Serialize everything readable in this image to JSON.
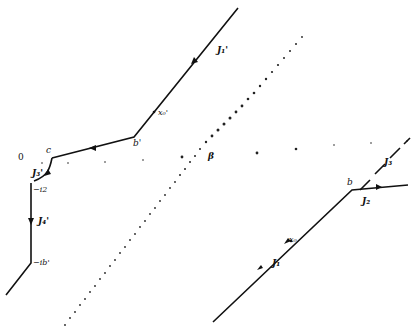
{
  "diagram": {
    "type": "complex-plane contour diagram",
    "colors": {
      "line": "#111111",
      "background": "#ffffff",
      "dots": "#222222"
    },
    "labels": {
      "origin": "0",
      "c": "c",
      "b_prime": "b'",
      "b": "b",
      "beta": "β",
      "minus_i2": "−i2",
      "minus_ib_prime": "−ib'",
      "x0": "x₀",
      "x0_prime": "x₀'",
      "J1": "J₁",
      "J2": "J₂",
      "J3": "J₃",
      "J1_prime": "J₁'",
      "J3_prime": "J₃'",
      "J4_prime": "J₄'"
    },
    "contours": [
      {
        "name": "J1",
        "points": [
          [
            213,
            322
          ],
          [
            352,
            190
          ]
        ],
        "arrow": "up-right"
      },
      {
        "name": "J2",
        "points": [
          [
            352,
            190
          ],
          [
            408,
            185
          ]
        ],
        "arrow": "right"
      },
      {
        "name": "J3",
        "style": "dashed",
        "points": [
          [
            358,
            193
          ],
          [
            410,
            141
          ]
        ]
      },
      {
        "name": "J1_prime",
        "points": [
          [
            238,
            8
          ],
          [
            134,
            137
          ]
        ],
        "arrow": "down-left"
      },
      {
        "name": "J2_prime_segment",
        "points": [
          [
            134,
            137
          ],
          [
            52,
            160
          ]
        ],
        "arrow": "left"
      },
      {
        "name": "J3_prime",
        "points": [
          [
            52,
            160
          ],
          [
            49,
            174
          ],
          [
            34,
            183
          ]
        ],
        "arrow": "down"
      },
      {
        "name": "J4_prime",
        "points": [
          [
            31,
            185
          ],
          [
            31,
            263
          ]
        ],
        "arrow": "down"
      },
      {
        "name": "tail",
        "points": [
          [
            31,
            263
          ],
          [
            6,
            295
          ]
        ]
      }
    ],
    "dotted_line": {
      "from": [
        65,
        325
      ],
      "to": [
        306,
        8
      ]
    }
  }
}
